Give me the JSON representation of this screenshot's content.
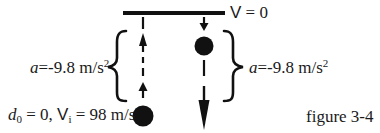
{
  "figure": {
    "caption": "figure 3-4",
    "top_label": {
      "symbol": "V",
      "equals": "= 0"
    },
    "left_label": {
      "symbol": "a",
      "value": "=-9.8 m/s",
      "exponent": "2"
    },
    "right_label": {
      "symbol": "a",
      "value": "=-9.8 m/s",
      "exponent": "2"
    },
    "bottom_label": {
      "d_symbol": "d",
      "d_subscript": "0",
      "d_value": "= 0,",
      "v_symbol": "V",
      "v_subscript": "i",
      "v_value": "= 98 m/s"
    },
    "elements": {
      "ceiling_line": "max-height-line",
      "left_path": "upward-trajectory",
      "right_path": "downward-trajectory",
      "ball_start": "ball-at-launch",
      "ball_top": "ball-at-apex"
    },
    "colors": {
      "ink": "#111111",
      "background": "#ffffff"
    }
  }
}
